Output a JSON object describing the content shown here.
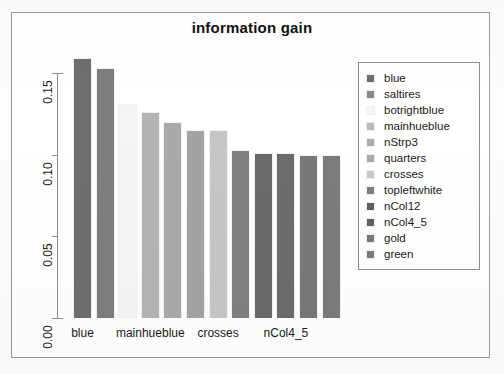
{
  "chart_data": {
    "type": "bar",
    "title": "information gain",
    "xlabel": "",
    "ylabel": "",
    "ylim": [
      0.0,
      0.16
    ],
    "grid": false,
    "legend_position": "right",
    "y_ticks": [
      "0.00",
      "0.05",
      "0.10",
      "0.15"
    ],
    "y_tick_values": [
      0.0,
      0.05,
      0.1,
      0.15
    ],
    "x_tick_labels": [
      "blue",
      "mainhueblue",
      "crosses",
      "nCol4_5"
    ],
    "categories": [
      "blue",
      "saltires",
      "botrightblue",
      "mainhueblue",
      "nStrp3",
      "quarters",
      "crosses",
      "topleftwhite",
      "nCol12",
      "nCol4_5",
      "gold",
      "green"
    ],
    "values": [
      0.159,
      0.153,
      0.131,
      0.126,
      0.12,
      0.115,
      0.115,
      0.103,
      0.101,
      0.101,
      0.1,
      0.1
    ],
    "bar_colors": [
      "#6e6e6e",
      "#7e7e7e",
      "#f4f4f2",
      "#b4b4b4",
      "#a9a9a9",
      "#a3a3a3",
      "#c6c6c6",
      "#808080",
      "#6a6a6a",
      "#6c6c6c",
      "#787878",
      "#7b7b7b"
    ]
  },
  "legend": {
    "items": [
      {
        "label": "blue",
        "color": "#6e6e6e"
      },
      {
        "label": "saltires",
        "color": "#8a8a8a"
      },
      {
        "label": "botrightblue",
        "color": "#f6f6f4"
      },
      {
        "label": "mainhueblue",
        "color": "#b9b9b9"
      },
      {
        "label": "nStrp3",
        "color": "#adadad"
      },
      {
        "label": "quarters",
        "color": "#aaaaaa"
      },
      {
        "label": "crosses",
        "color": "#c9c9c9"
      },
      {
        "label": "topleftwhite",
        "color": "#7f7f7f"
      },
      {
        "label": "nCol12",
        "color": "#5f5f5f"
      },
      {
        "label": "nCol4_5",
        "color": "#636363"
      },
      {
        "label": "gold",
        "color": "#7a7a7a"
      },
      {
        "label": "green",
        "color": "#7d7d7d"
      }
    ]
  },
  "axes": {
    "baseline_value": "0.00",
    "top_value": "0.15"
  }
}
